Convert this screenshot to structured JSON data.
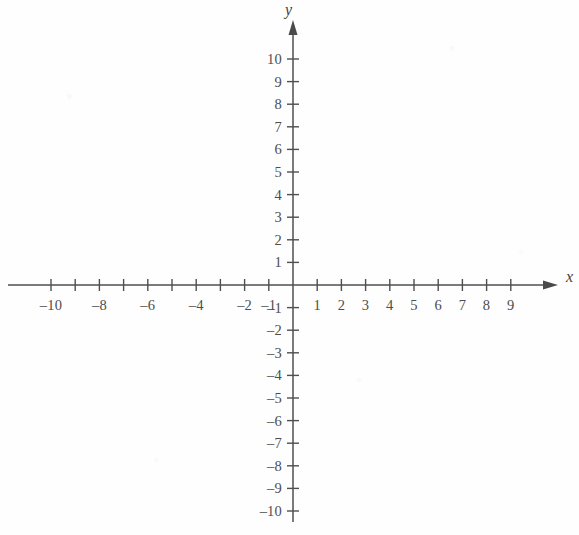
{
  "figure": {
    "kind": "cartesian-coordinate-plane",
    "width": 579,
    "height": 535,
    "background_color": "#fefefe",
    "ink_color": "#4f4f4f"
  },
  "chart_data": {
    "type": "scatter",
    "title": "",
    "subtitle": "",
    "xlabel": "x",
    "ylabel": "y",
    "xlim": [
      -10,
      9
    ],
    "ylim": [
      -10,
      10
    ],
    "grid": false,
    "legend": null,
    "series": [],
    "annotations": [],
    "x_axis": {
      "name": "x",
      "arrow_direction": "right",
      "tick_values": [
        -10,
        -9,
        -8,
        -7,
        -6,
        -5,
        -4,
        -3,
        -2,
        -1,
        1,
        2,
        3,
        4,
        5,
        6,
        7,
        8,
        9
      ],
      "labeled_ticks": [
        {
          "value": -10,
          "text": "–10"
        },
        {
          "value": -8,
          "text": "–8"
        },
        {
          "value": -6,
          "text": "–6"
        },
        {
          "value": -4,
          "text": "–4"
        },
        {
          "value": -2,
          "text": "–2"
        },
        {
          "value": -1,
          "text": "–1"
        },
        {
          "value": 1,
          "text": "1"
        },
        {
          "value": 2,
          "text": "2"
        },
        {
          "value": 3,
          "text": "3"
        },
        {
          "value": 4,
          "text": "4"
        },
        {
          "value": 5,
          "text": "5"
        },
        {
          "value": 6,
          "text": "6"
        },
        {
          "value": 7,
          "text": "7"
        },
        {
          "value": 8,
          "text": "8"
        },
        {
          "value": 9,
          "text": "9"
        }
      ]
    },
    "y_axis": {
      "name": "y",
      "arrow_direction": "up",
      "tick_values": [
        -10,
        -9,
        -8,
        -7,
        -6,
        -5,
        -4,
        -3,
        -2,
        -1,
        1,
        2,
        3,
        4,
        5,
        6,
        7,
        8,
        9,
        10
      ],
      "labeled_ticks": [
        {
          "value": 10,
          "text": "10"
        },
        {
          "value": 9,
          "text": "9"
        },
        {
          "value": 8,
          "text": "8"
        },
        {
          "value": 7,
          "text": "7"
        },
        {
          "value": 6,
          "text": "6"
        },
        {
          "value": 5,
          "text": "5"
        },
        {
          "value": 4,
          "text": "4"
        },
        {
          "value": 3,
          "text": "3"
        },
        {
          "value": 2,
          "text": "2"
        },
        {
          "value": 1,
          "text": "1"
        },
        {
          "value": -1,
          "text": "–1"
        },
        {
          "value": -2,
          "text": "–2"
        },
        {
          "value": -3,
          "text": "–3"
        },
        {
          "value": -4,
          "text": "–4"
        },
        {
          "value": -5,
          "text": "–5"
        },
        {
          "value": -6,
          "text": "–6"
        },
        {
          "value": -7,
          "text": "–7"
        },
        {
          "value": -8,
          "text": "–8"
        },
        {
          "value": -9,
          "text": "–9"
        },
        {
          "value": -10,
          "text": "–10"
        }
      ]
    },
    "origin_label": "",
    "data_points": []
  },
  "geometry": {
    "origin_x": 293,
    "origin_y": 285,
    "unit_x": 24.2,
    "unit_y": 22.6,
    "x_axis_start_px": 8,
    "x_axis_end_px": 548,
    "y_axis_top_px": 30,
    "y_axis_bottom_px": 522,
    "tick_half_len_x": 6,
    "tick_half_len_y": 6
  },
  "labels": {
    "x_name": "x",
    "y_name": "y"
  }
}
